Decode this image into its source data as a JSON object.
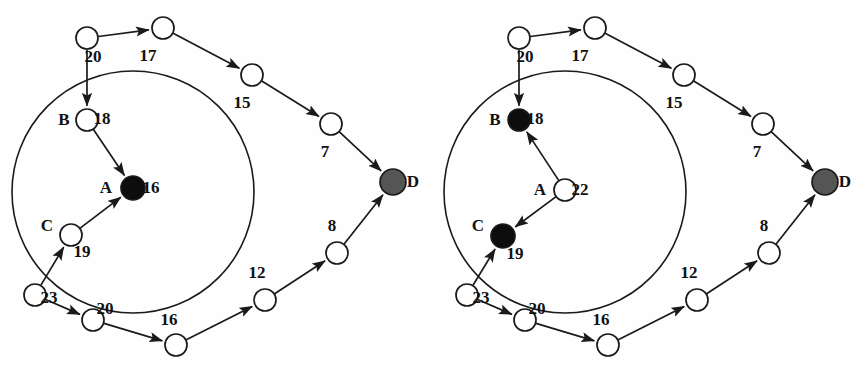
{
  "figure": {
    "width": 863,
    "height": 370,
    "background": "#fefefe",
    "stroke": "#1a1a1a",
    "node_fill_white": "#ffffff",
    "node_fill_black": "#0d0d0d",
    "node_fill_gray": "#555555"
  },
  "chart_data": {
    "type": "diagram",
    "title": "",
    "subtitle": "",
    "panels": [
      {
        "id": "left",
        "label": "",
        "cluster_circle": {
          "cx": 133,
          "cy": 192,
          "r": 121
        },
        "nodes": [
          {
            "id": "L1",
            "x": 87,
            "y": 38,
            "r": 11,
            "fill": "white",
            "value": "20",
            "value_dx": 6,
            "value_dy": 24,
            "name": ""
          },
          {
            "id": "L2",
            "x": 163,
            "y": 28,
            "r": 11,
            "fill": "white",
            "value": "17",
            "value_dx": -15,
            "value_dy": 33,
            "name": ""
          },
          {
            "id": "L3",
            "x": 252,
            "y": 75,
            "r": 11,
            "fill": "white",
            "value": "15",
            "value_dx": -10,
            "value_dy": 33,
            "name": ""
          },
          {
            "id": "L4",
            "x": 331,
            "y": 124,
            "r": 11,
            "fill": "white",
            "value": "7",
            "value_dx": -6,
            "value_dy": 33,
            "name": ""
          },
          {
            "id": "LD",
            "x": 393,
            "y": 182,
            "r": 13,
            "fill": "gray",
            "value": "",
            "value_dx": 0,
            "value_dy": 0,
            "name": "D",
            "name_dx": 20,
            "name_dy": 5
          },
          {
            "id": "LB",
            "x": 87,
            "y": 120,
            "r": 11,
            "fill": "white",
            "value": "18",
            "value_dx": 15,
            "value_dy": 4,
            "name": "B",
            "name_dx": -23,
            "name_dy": 5
          },
          {
            "id": "LA",
            "x": 133,
            "y": 188,
            "r": 12,
            "fill": "black",
            "value": "16",
            "value_dx": 18,
            "value_dy": 5,
            "name": "A",
            "name_dx": -27,
            "name_dy": 5
          },
          {
            "id": "LC",
            "x": 71,
            "y": 235,
            "r": 11,
            "fill": "white",
            "value": "19",
            "value_dx": 11,
            "value_dy": 22,
            "name": "C",
            "name_dx": -24,
            "name_dy": -4
          },
          {
            "id": "L5",
            "x": 35,
            "y": 295,
            "r": 11,
            "fill": "white",
            "value": "23",
            "value_dx": 14,
            "value_dy": 8,
            "name": ""
          },
          {
            "id": "L6",
            "x": 93,
            "y": 320,
            "r": 11,
            "fill": "white",
            "value": "20",
            "value_dx": 12,
            "value_dy": -6,
            "name": ""
          },
          {
            "id": "L7",
            "x": 176,
            "y": 345,
            "r": 11,
            "fill": "white",
            "value": "16",
            "value_dx": -7,
            "value_dy": -20,
            "name": ""
          },
          {
            "id": "L8",
            "x": 265,
            "y": 300,
            "r": 11,
            "fill": "white",
            "value": "12",
            "value_dx": -8,
            "value_dy": -22,
            "name": ""
          },
          {
            "id": "L9",
            "x": 337,
            "y": 253,
            "r": 11,
            "fill": "white",
            "value": "8",
            "value_dx": -5,
            "value_dy": -22,
            "name": ""
          }
        ],
        "edges": [
          {
            "from": "L1",
            "to": "L2",
            "arrow": true
          },
          {
            "from": "L1",
            "to": "LB",
            "arrow": true
          },
          {
            "from": "L2",
            "to": "L3",
            "arrow": true
          },
          {
            "from": "L3",
            "to": "L4",
            "arrow": true
          },
          {
            "from": "L4",
            "to": "LD",
            "arrow": true
          },
          {
            "from": "LB",
            "to": "LA",
            "arrow": true
          },
          {
            "from": "LC",
            "to": "LA",
            "arrow": true
          },
          {
            "from": "L5",
            "to": "LC",
            "arrow": true
          },
          {
            "from": "L5",
            "to": "L6",
            "arrow": true
          },
          {
            "from": "L6",
            "to": "L7",
            "arrow": true
          },
          {
            "from": "L7",
            "to": "L8",
            "arrow": true
          },
          {
            "from": "L8",
            "to": "L9",
            "arrow": true
          },
          {
            "from": "L9",
            "to": "LD",
            "arrow": true
          }
        ]
      },
      {
        "id": "right",
        "label": "",
        "cluster_circle": {
          "cx": 565,
          "cy": 192,
          "r": 121
        },
        "nodes": [
          {
            "id": "R1",
            "x": 519,
            "y": 38,
            "r": 11,
            "fill": "white",
            "value": "20",
            "value_dx": 6,
            "value_dy": 24,
            "name": ""
          },
          {
            "id": "R2",
            "x": 595,
            "y": 28,
            "r": 11,
            "fill": "white",
            "value": "17",
            "value_dx": -15,
            "value_dy": 33,
            "name": ""
          },
          {
            "id": "R3",
            "x": 684,
            "y": 75,
            "r": 11,
            "fill": "white",
            "value": "15",
            "value_dx": -10,
            "value_dy": 33,
            "name": ""
          },
          {
            "id": "R4",
            "x": 763,
            "y": 124,
            "r": 11,
            "fill": "white",
            "value": "7",
            "value_dx": -6,
            "value_dy": 33,
            "name": ""
          },
          {
            "id": "RD",
            "x": 825,
            "y": 182,
            "r": 13,
            "fill": "gray",
            "value": "",
            "value_dx": 0,
            "value_dy": 0,
            "name": "D",
            "name_dx": 20,
            "name_dy": 5
          },
          {
            "id": "RB",
            "x": 519,
            "y": 120,
            "r": 11,
            "fill": "black",
            "value": "18",
            "value_dx": 16,
            "value_dy": 4,
            "name": "B",
            "name_dx": -24,
            "name_dy": 5
          },
          {
            "id": "RA",
            "x": 565,
            "y": 190,
            "r": 11,
            "fill": "white",
            "value": "22",
            "value_dx": 15,
            "value_dy": 5,
            "name": "A",
            "name_dx": -25,
            "name_dy": 5
          },
          {
            "id": "RC",
            "x": 503,
            "y": 236,
            "r": 12,
            "fill": "black",
            "value": "19",
            "value_dx": 12,
            "value_dy": 23,
            "name": "C",
            "name_dx": -25,
            "name_dy": -5
          },
          {
            "id": "R5",
            "x": 467,
            "y": 295,
            "r": 11,
            "fill": "white",
            "value": "23",
            "value_dx": 14,
            "value_dy": 8,
            "name": ""
          },
          {
            "id": "R6",
            "x": 525,
            "y": 320,
            "r": 11,
            "fill": "white",
            "value": "20",
            "value_dx": 12,
            "value_dy": -6,
            "name": ""
          },
          {
            "id": "R7",
            "x": 608,
            "y": 345,
            "r": 11,
            "fill": "white",
            "value": "16",
            "value_dx": -7,
            "value_dy": -20,
            "name": ""
          },
          {
            "id": "R8",
            "x": 697,
            "y": 300,
            "r": 11,
            "fill": "white",
            "value": "12",
            "value_dx": -8,
            "value_dy": -22,
            "name": ""
          },
          {
            "id": "R9",
            "x": 769,
            "y": 253,
            "r": 11,
            "fill": "white",
            "value": "8",
            "value_dx": -5,
            "value_dy": -22,
            "name": ""
          }
        ],
        "edges": [
          {
            "from": "R1",
            "to": "R2",
            "arrow": true
          },
          {
            "from": "R1",
            "to": "RB",
            "arrow": true
          },
          {
            "from": "R2",
            "to": "R3",
            "arrow": true
          },
          {
            "from": "R3",
            "to": "R4",
            "arrow": true
          },
          {
            "from": "R4",
            "to": "RD",
            "arrow": true
          },
          {
            "from": "RA",
            "to": "RB",
            "arrow": true
          },
          {
            "from": "RA",
            "to": "RC",
            "arrow": true
          },
          {
            "from": "R5",
            "to": "RC",
            "arrow": true
          },
          {
            "from": "R5",
            "to": "R6",
            "arrow": true
          },
          {
            "from": "R6",
            "to": "R7",
            "arrow": true
          },
          {
            "from": "R7",
            "to": "R8",
            "arrow": true
          },
          {
            "from": "R8",
            "to": "R9",
            "arrow": true
          },
          {
            "from": "R9",
            "to": "RD",
            "arrow": true
          }
        ]
      }
    ],
    "all_edge_weights": [
      "20",
      "17",
      "15",
      "7",
      "18",
      "16",
      "19",
      "23",
      "20",
      "16",
      "12",
      "8",
      "22"
    ],
    "node_letters": [
      "A",
      "B",
      "C",
      "D"
    ]
  }
}
